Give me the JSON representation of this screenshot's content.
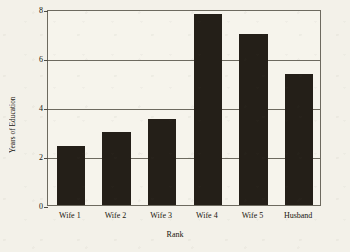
{
  "chart_data": {
    "type": "bar",
    "title": "",
    "xlabel": "Rank",
    "ylabel": "Years of Education",
    "categories": [
      "Wife 1",
      "Wife 2",
      "Wife 3",
      "Wife 4",
      "Wife 5",
      "Husband"
    ],
    "values": [
      2.4,
      3.0,
      3.5,
      7.8,
      7.0,
      5.35
    ],
    "ylim": [
      0,
      8
    ],
    "yticks": [
      0,
      2,
      4,
      6,
      8
    ],
    "ytick_labels": [
      "0",
      "2",
      "4",
      "6",
      "8"
    ],
    "grid": "horizontal",
    "legend": "none",
    "bar_color": "#241f18",
    "plot_background": "#f6f4ec",
    "figure_background": "#f3f1e9",
    "axis_color": "#6d6a5f"
  }
}
